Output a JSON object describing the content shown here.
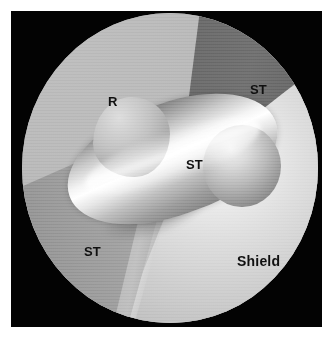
{
  "figure": {
    "kind": "shaded-geometry-render",
    "viewport_shape": "circle",
    "background_color": "#030303",
    "frame_color": "#ffffff",
    "label_color": "#101010"
  },
  "regions": [
    {
      "id": "r-plate",
      "label": "R",
      "tone": "light-gray",
      "fill": "#b6b6b6",
      "position": "upper-left"
    },
    {
      "id": "st-upper-right",
      "label": "ST",
      "tone": "dark-gray",
      "fill": "#666666",
      "position": "upper-right-band"
    },
    {
      "id": "st-center-tube",
      "label": "ST",
      "tone": "specular-white",
      "fill": "#ffffff",
      "position": "center-tube"
    },
    {
      "id": "st-lower-left",
      "label": "ST",
      "tone": "mid-gray",
      "fill": "#a6a6a6",
      "position": "lower-left-band"
    },
    {
      "id": "shield",
      "label": "Shield",
      "tone": "bright-gray",
      "fill": "#dcdcdc",
      "position": "lower-right"
    }
  ],
  "labels": {
    "r": "R",
    "st_upper_right": "ST",
    "st_center": "ST",
    "st_lower_left": "ST",
    "shield": "Shield"
  }
}
